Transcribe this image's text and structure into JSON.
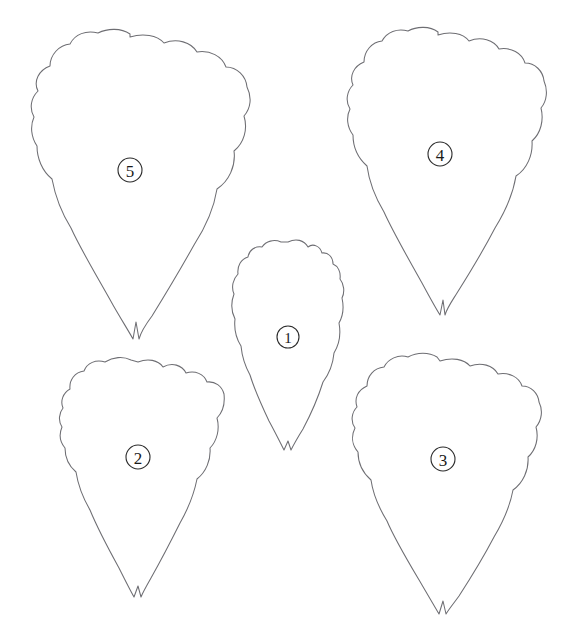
{
  "document": {
    "kind": "line-drawing-plate",
    "title": "Numbered petal outline plate",
    "background_color": "#ffffff",
    "outline_color": "#6e6e73",
    "label_color": "#1a1a1a",
    "width": 563,
    "height": 636
  },
  "figure": {
    "caption": "",
    "shape_count": 5,
    "shape_kind": "petal outline with lobed margin and notched tip"
  },
  "shapes": [
    {
      "id": "petal-1",
      "label": "1",
      "label_style": "circled-number",
      "label_x": 288,
      "label_y": 337,
      "label_radius": 11,
      "bounds": {
        "x": 232,
        "y": 238,
        "width": 112,
        "height": 220
      },
      "tip_x": 288,
      "tip_y": 455,
      "size_rank": "smallest",
      "path": "M 288 242 C 296 238 304 240 308 247 C 313 243 320 246 322 253 C 328 252 333 257 333 264 C 338 266 341 272 340 279 C 344 284 345 292 342 298 C 344 307 343 316 339 323 C 341 334 339 345 334 353 C 333 364 329 374 323 382 C 318 398 311 414 303 429 C 298 437 294 444 291 450 L 288 441 L 284 450 C 280 442 275 432 269 421 C 261 404 254 388 250 375 C 245 366 242 356 241 346 C 236 338 234 328 235 319 C 231 311 231 302 234 294 C 231 287 233 279 238 274 C 237 266 241 259 248 257 C 249 250 255 246 262 247 C 266 241 274 239 281 242 Z"
    },
    {
      "id": "petal-2",
      "label": "2",
      "label_style": "circled-number",
      "label_x": 138,
      "label_y": 457,
      "label_radius": 12,
      "bounds": {
        "x": 60,
        "y": 358,
        "width": 165,
        "height": 245
      },
      "tip_x": 140,
      "tip_y": 600,
      "size_rank": "medium",
      "path": "M 138 362 C 148 358 158 360 163 367 C 172 362 182 365 186 373 C 195 370 204 374 207 382 C 215 381 222 386 224 394 C 225 403 223 412 217 418 C 220 429 217 441 210 448 C 211 460 206 472 197 479 C 194 494 188 509 180 523 C 170 543 160 562 151 578 C 147 585 143 592 141 597 L 138 586 L 134 597 C 130 590 125 580 119 568 C 108 548 97 527 90 510 C 83 498 78 485 76 472 C 69 466 65 457 65 448 C 60 442 59 434 62 427 C 58 421 59 413 63 408 C 60 401 63 393 70 389 C 69 380 75 372 84 371 C 87 363 96 359 105 362 C 113 357 123 356 131 360 Z"
    },
    {
      "id": "petal-3",
      "label": "3",
      "label_style": "circled-number",
      "label_x": 443,
      "label_y": 459,
      "label_radius": 12,
      "bounds": {
        "x": 342,
        "y": 357,
        "width": 190,
        "height": 258
      },
      "tip_x": 443,
      "tip_y": 613,
      "size_rank": "large",
      "path": "M 440 361 C 452 357 464 359 470 366 C 481 362 493 365 498 374 C 509 372 519 377 522 386 C 531 386 538 393 539 402 C 543 410 542 420 536 427 C 539 438 536 450 528 457 C 529 470 523 483 513 490 C 510 506 503 522 494 537 C 483 558 470 579 459 596 C 454 603 449 609 446 614 L 443 601 L 439 614 C 435 607 429 597 422 585 C 409 563 395 540 387 521 C 379 508 373 494 371 480 C 363 473 358 463 358 452 C 352 445 351 436 355 428 C 350 421 352 412 357 407 C 354 398 358 390 367 386 C 367 376 374 368 384 367 C 388 359 398 354 408 357 C 417 352 429 352 437 357 Z"
    },
    {
      "id": "petal-4",
      "label": "4",
      "label_style": "circled-number",
      "label_x": 440,
      "label_y": 154,
      "label_radius": 12,
      "bounds": {
        "x": 341,
        "y": 31,
        "width": 200,
        "height": 295
      },
      "tip_x": 443,
      "tip_y": 325,
      "size_rank": "large",
      "path": "M 438 35 C 450 31 463 33 469 41 C 481 36 494 40 499 49 C 511 47 522 53 525 63 C 535 63 543 71 544 81 C 548 90 547 101 541 108 C 544 120 541 133 532 141 C 533 155 527 169 516 176 C 513 194 505 212 495 228 C 483 251 469 274 457 293 C 452 301 447 308 445 315 L 443 300 L 440 315 C 435 307 429 296 422 283 C 408 258 393 232 384 212 C 375 197 369 181 367 166 C 358 158 353 147 353 135 C 347 127 346 117 350 109 C 345 101 347 91 353 85 C 349 76 354 66 364 62 C 364 51 372 42 382 41 C 387 32 397 28 408 31 C 417 26 430 26 438 32 Z"
    },
    {
      "id": "petal-5",
      "label": "5",
      "label_style": "circled-number",
      "label_x": 130,
      "label_y": 170,
      "label_radius": 12,
      "bounds": {
        "x": 16,
        "y": 33,
        "width": 232,
        "height": 310
      },
      "tip_x": 136,
      "tip_y": 341,
      "size_rank": "largest",
      "path": "M 130 37 C 143 33 157 35 164 43 C 177 38 191 42 197 52 C 210 50 222 56 226 67 C 237 67 246 76 247 87 C 252 97 251 108 244 116 C 248 129 244 143 234 151 C 236 166 229 181 217 189 C 214 208 205 228 194 245 C 180 270 165 295 152 316 C 146 324 141 332 139 339 L 136 322 L 133 339 C 128 330 121 319 113 305 C 98 278 81 250 71 228 C 61 212 55 195 52 179 C 42 171 37 158 37 146 C 31 137 30 126 34 117 C 29 108 31 98 38 91 C 33 81 39 70 50 66 C 50 55 59 45 70 44 C 75 34 86 30 98 33 C 108 28 121 28 130 34 Z"
    }
  ]
}
